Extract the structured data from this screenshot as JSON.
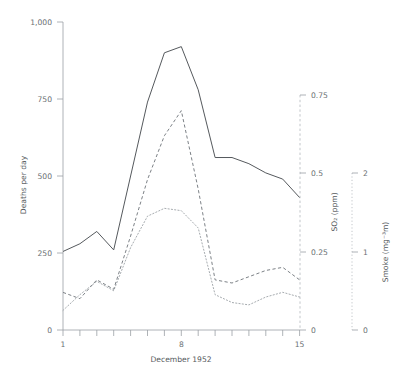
{
  "chart_data": {
    "type": "line",
    "title": "",
    "xlabel": "December 1952",
    "x": [
      1,
      2,
      3,
      4,
      5,
      6,
      7,
      8,
      9,
      10,
      11,
      12,
      13,
      14,
      15
    ],
    "xticks": [
      1,
      8,
      15
    ],
    "xlim": [
      1,
      15
    ],
    "grid": false,
    "legend": "none",
    "series": [
      {
        "name": "Deaths per day",
        "style": "solid",
        "axis": "left",
        "ylabel": "Deaths per day",
        "yticks": [
          0,
          250,
          500,
          750,
          1000
        ],
        "yticklabels": [
          "0",
          "250",
          "500",
          "750",
          "1,000"
        ],
        "ylim": [
          0,
          1000
        ],
        "values": [
          255,
          280,
          320,
          260,
          500,
          740,
          900,
          920,
          780,
          560,
          560,
          540,
          510,
          490,
          430
        ]
      },
      {
        "name": "SO2",
        "style": "dashed",
        "axis": "right-1",
        "ylabel": "SO₂ (ppm)",
        "yticks": [
          0,
          0.25,
          0.5,
          0.75
        ],
        "yticklabels": [
          "0",
          "0.25",
          "0.5",
          "0.75"
        ],
        "ylim": [
          0,
          0.8
        ],
        "values": [
          0.12,
          0.1,
          0.16,
          0.13,
          0.3,
          0.48,
          0.62,
          0.7,
          0.45,
          0.16,
          0.15,
          0.17,
          0.19,
          0.2,
          0.16
        ]
      },
      {
        "name": "Smoke",
        "style": "dotted",
        "axis": "right-2",
        "ylabel": "Smoke (mg⁻³m)",
        "yticks": [
          0,
          1,
          2
        ],
        "yticklabels": [
          "0",
          "1",
          "2"
        ],
        "ylim": [
          0,
          2.2
        ],
        "values": [
          0.25,
          0.45,
          0.62,
          0.5,
          1.05,
          1.45,
          1.55,
          1.52,
          1.3,
          0.45,
          0.35,
          0.32,
          0.42,
          0.48,
          0.42
        ]
      }
    ]
  },
  "axes": {
    "left": {
      "title": "Deaths per day",
      "labels": [
        "1,000",
        "750",
        "500",
        "250",
        "0"
      ]
    },
    "bottom": {
      "title": "December 1952",
      "labels": [
        "1",
        "8",
        "15"
      ]
    },
    "right_so2": {
      "title": "SO₂ (ppm)",
      "labels": [
        "0.75",
        "0.5",
        "0.25",
        "0"
      ]
    },
    "right_smoke": {
      "title": "Smoke (mg⁻³m)",
      "labels": [
        "2",
        "1",
        "0"
      ]
    }
  }
}
